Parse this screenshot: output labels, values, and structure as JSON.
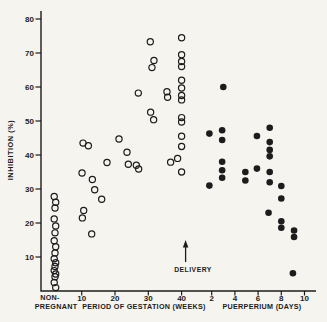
{
  "figure": {
    "background": "#f5f4ef",
    "ink": "#1c1c1c"
  },
  "chart_data": {
    "type": "scatter",
    "title": "",
    "ylabel": "INHIBITION (%)",
    "ylim": [
      0,
      80
    ],
    "yticks": [
      80,
      70,
      60,
      50,
      40,
      30,
      20,
      10
    ],
    "grid": false,
    "x_axis": {
      "segments": [
        {
          "name": "non-pregnant",
          "label_line1": "NON-",
          "label_line2": "PREGNANT"
        },
        {
          "name": "gestation",
          "label": "PERIOD OF GESTATION (WEEKS)",
          "ticks": [
            10,
            20,
            30,
            40
          ]
        },
        {
          "name": "puerperium",
          "label": "PUERPERIUM (DAYS)",
          "ticks": [
            2,
            4,
            6,
            8,
            10
          ]
        }
      ]
    },
    "annotation": {
      "text": "DELIVERY",
      "at_week": 40
    },
    "series": [
      {
        "name": "non-pregnant",
        "marker": "open-circle",
        "values": [
          27.8,
          26.1,
          24.4,
          21.2,
          19.1,
          17.1,
          14.8,
          13,
          11.2,
          9.5,
          8.3,
          7.2,
          6,
          5,
          4.2,
          2.5,
          1
        ]
      },
      {
        "name": "gestation",
        "marker": "open-circle",
        "points": [
          [
            10.4,
            43.5
          ],
          [
            12,
            42.7
          ],
          [
            10.1,
            34.7
          ],
          [
            13.2,
            32.8
          ],
          [
            13.9,
            29.8
          ],
          [
            16,
            27
          ],
          [
            10.6,
            23.7
          ],
          [
            10.2,
            21.5
          ],
          [
            13,
            16.8
          ],
          [
            17.6,
            37.8
          ],
          [
            21.2,
            44.7
          ],
          [
            23.6,
            40.8
          ],
          [
            24,
            37.3
          ],
          [
            26.4,
            37
          ],
          [
            27,
            58.2
          ],
          [
            27.1,
            35.9
          ],
          [
            30.6,
            73.3
          ],
          [
            31.7,
            67.8
          ],
          [
            31.1,
            65.7
          ],
          [
            30.7,
            52.6
          ],
          [
            31.6,
            50.4
          ],
          [
            35.6,
            58.6
          ],
          [
            35.8,
            57
          ],
          [
            36.7,
            37.9
          ],
          [
            40,
            74.5
          ],
          [
            40,
            69.5
          ],
          [
            40,
            67.5
          ],
          [
            40,
            66
          ],
          [
            40,
            62
          ],
          [
            40,
            59.7
          ],
          [
            40,
            57.5
          ],
          [
            40,
            56.2
          ],
          [
            40,
            51
          ],
          [
            40,
            49.7
          ],
          [
            40,
            45.5
          ],
          [
            40,
            42.5
          ],
          [
            38.8,
            39
          ],
          [
            40,
            35
          ]
        ]
      },
      {
        "name": "puerperium",
        "marker": "filled-circle",
        "points": [
          [
            3,
            60
          ],
          [
            1.8,
            46.3
          ],
          [
            2.9,
            47.3
          ],
          [
            2.9,
            44.4
          ],
          [
            2.9,
            38
          ],
          [
            2.9,
            35.5
          ],
          [
            2.9,
            33.3
          ],
          [
            1.8,
            31
          ],
          [
            4.9,
            35
          ],
          [
            4.9,
            32.5
          ],
          [
            5.9,
            45.6
          ],
          [
            5.9,
            36
          ],
          [
            7,
            48
          ],
          [
            7,
            43.8
          ],
          [
            7,
            41.5
          ],
          [
            7,
            39.6
          ],
          [
            7,
            35
          ],
          [
            7,
            32
          ],
          [
            6.9,
            23
          ],
          [
            8,
            30.9
          ],
          [
            8,
            27.2
          ],
          [
            8,
            20.5
          ],
          [
            8,
            18.6
          ],
          [
            9.1,
            17.8
          ],
          [
            9.1,
            15.9
          ],
          [
            9,
            5.2
          ]
        ]
      }
    ]
  }
}
